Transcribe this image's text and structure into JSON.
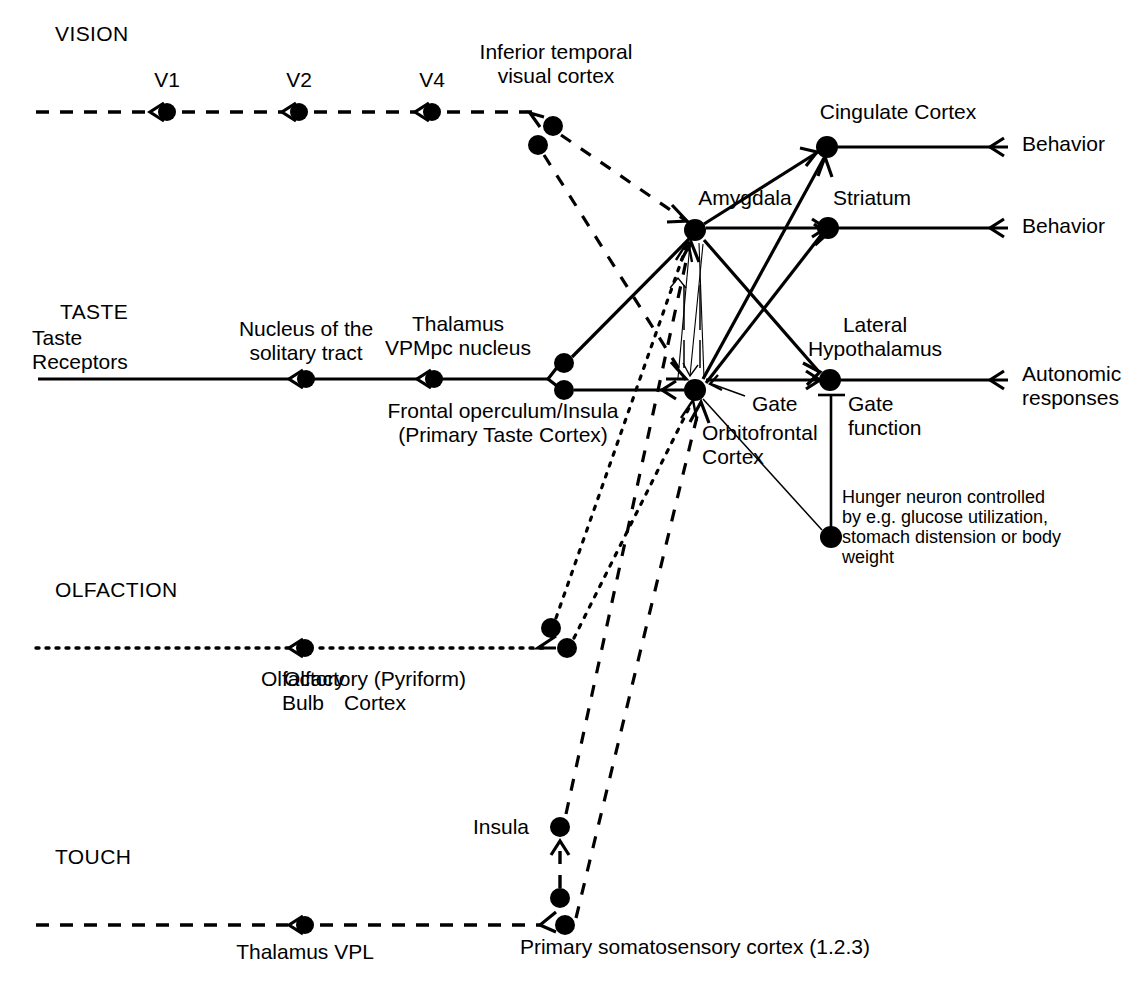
{
  "figure": {
    "domain": "brain-pathway-diagram"
  },
  "sections": [
    {
      "id": "vision",
      "label": "VISION",
      "x": 55,
      "y": 22
    },
    {
      "id": "taste",
      "label": "TASTE",
      "x": 60,
      "y": 300
    },
    {
      "id": "olfaction",
      "label": "OLFACTION",
      "x": 55,
      "y": 578
    },
    {
      "id": "touch",
      "label": "TOUCH",
      "x": 55,
      "y": 845
    }
  ],
  "labels": [
    {
      "id": "taste-receptors",
      "text": "Taste\nReceptors",
      "x": 32,
      "y": 326,
      "align": "left",
      "w": 130
    },
    {
      "id": "v1",
      "text": "V1",
      "x": 167,
      "y": 68,
      "align": "center",
      "w": 60
    },
    {
      "id": "v2",
      "text": "V2",
      "x": 299,
      "y": 68,
      "align": "center",
      "w": 60
    },
    {
      "id": "v4",
      "text": "V4",
      "x": 432,
      "y": 68,
      "align": "center",
      "w": 60
    },
    {
      "id": "it-cortex",
      "text": "Inferior temporal\nvisual cortex",
      "x": 556,
      "y": 40,
      "align": "center",
      "w": 220
    },
    {
      "id": "cingulate-cortex",
      "text": "Cingulate Cortex",
      "x": 898,
      "y": 100,
      "align": "center",
      "w": 220
    },
    {
      "id": "amygdala",
      "text": "Amygdala",
      "x": 745,
      "y": 186,
      "align": "center",
      "w": 150
    },
    {
      "id": "striatum",
      "text": "Striatum",
      "x": 872,
      "y": 186,
      "align": "center",
      "w": 140
    },
    {
      "id": "behavior-1",
      "text": "Behavior",
      "x": 1022,
      "y": 132,
      "align": "left",
      "w": 150
    },
    {
      "id": "behavior-2",
      "text": "Behavior",
      "x": 1022,
      "y": 214,
      "align": "left",
      "w": 150
    },
    {
      "id": "nucleus-solitary",
      "text": "Nucleus of the\nsolitary tract",
      "x": 306,
      "y": 317,
      "align": "center",
      "w": 200
    },
    {
      "id": "thalamus-vpmpc",
      "text": "Thalamus\nVPMpc nucleus",
      "x": 458,
      "y": 312,
      "align": "center",
      "w": 220
    },
    {
      "id": "lateral-hypo",
      "text": "Lateral\nHypothalamus",
      "x": 875,
      "y": 313,
      "align": "center",
      "w": 190
    },
    {
      "id": "autonomic",
      "text": "Autonomic\nresponses",
      "x": 1022,
      "y": 362,
      "align": "left",
      "w": 160
    },
    {
      "id": "frontal-operculum",
      "text": "Frontal operculum/Insula\n(Primary Taste Cortex)",
      "x": 503,
      "y": 399,
      "align": "center",
      "w": 330
    },
    {
      "id": "gate",
      "text": "Gate",
      "x": 752,
      "y": 392,
      "align": "left",
      "w": 90
    },
    {
      "id": "gate-function",
      "text": "Gate\nfunction",
      "x": 848,
      "y": 392,
      "align": "left",
      "w": 120
    },
    {
      "id": "orbitofrontal",
      "text": "Orbitofrontal\nCortex",
      "x": 702,
      "y": 421,
      "align": "left",
      "w": 180
    },
    {
      "id": "hunger-neuron",
      "text": "Hunger neuron controlled\nby e.g. glucose utilization,\nstomach distension or body\nweight",
      "x": 842,
      "y": 487,
      "align": "left",
      "w": 250,
      "size": 18
    },
    {
      "id": "olfactory-bulb",
      "text": "Olfactory\nBulb",
      "x": 303,
      "y": 667,
      "align": "center",
      "w": 160
    },
    {
      "id": "olfactory-cortex",
      "text": "Olfactory (Pyriform)\nCortex",
      "x": 375,
      "y": 667,
      "align": "center",
      "w": 290
    },
    {
      "id": "insula",
      "text": "Insula",
      "x": 473,
      "y": 815,
      "align": "left",
      "w": 90
    },
    {
      "id": "thalamus-vpl",
      "text": "Thalamus VPL",
      "x": 305,
      "y": 940,
      "align": "center",
      "w": 210
    },
    {
      "id": "somatosensory",
      "text": "Primary somatosensory cortex (1.2.3)",
      "x": 695,
      "y": 935,
      "align": "center",
      "w": 500
    }
  ],
  "nodes": [
    {
      "id": "v1",
      "label": "V1",
      "x": 167,
      "y": 112,
      "r": 9
    },
    {
      "id": "v2",
      "label": "V2",
      "x": 299,
      "y": 112,
      "r": 9
    },
    {
      "id": "v4",
      "label": "V4",
      "x": 432,
      "y": 112,
      "r": 9
    },
    {
      "id": "it-upper",
      "label": "Inferior temporal visual cortex",
      "x": 553,
      "y": 126,
      "r": 10
    },
    {
      "id": "it-lower",
      "label": "Inferior temporal visual cortex",
      "x": 538,
      "y": 145,
      "r": 10
    },
    {
      "id": "nucleus-solitary",
      "label": "Nucleus of the solitary tract",
      "x": 306,
      "y": 379,
      "r": 9
    },
    {
      "id": "thalamus-vpmpc",
      "label": "Thalamus VPMpc nucleus",
      "x": 434,
      "y": 379,
      "r": 9
    },
    {
      "id": "operculum-upper",
      "label": "Frontal operculum/Insula",
      "x": 564,
      "y": 363,
      "r": 10
    },
    {
      "id": "operculum-lower",
      "label": "Frontal operculum/Insula",
      "x": 564,
      "y": 390,
      "r": 10
    },
    {
      "id": "amygdala",
      "label": "Amygdala",
      "x": 695,
      "y": 230,
      "r": 11
    },
    {
      "id": "cingulate",
      "label": "Cingulate Cortex",
      "x": 827,
      "y": 147,
      "r": 11
    },
    {
      "id": "striatum",
      "label": "Striatum",
      "x": 828,
      "y": 228,
      "r": 11
    },
    {
      "id": "orbitofrontal",
      "label": "Orbitofrontal Cortex",
      "x": 695,
      "y": 390,
      "r": 11
    },
    {
      "id": "lateral-hypo",
      "label": "Lateral Hypothalamus",
      "x": 830,
      "y": 380,
      "r": 11
    },
    {
      "id": "hunger",
      "label": "Hunger neuron",
      "x": 831,
      "y": 537,
      "r": 11
    },
    {
      "id": "olfactory-bulb",
      "label": "Olfactory Bulb",
      "x": 305,
      "y": 648,
      "r": 9
    },
    {
      "id": "pyriform-upper",
      "label": "Olfactory (Pyriform) Cortex",
      "x": 551,
      "y": 628,
      "r": 10
    },
    {
      "id": "pyriform-lower",
      "label": "Olfactory (Pyriform) Cortex",
      "x": 567,
      "y": 648,
      "r": 10
    },
    {
      "id": "insula",
      "label": "Insula",
      "x": 560,
      "y": 827,
      "r": 10
    },
    {
      "id": "somato-upper",
      "label": "Primary somatosensory cortex",
      "x": 560,
      "y": 898,
      "r": 10
    },
    {
      "id": "somato-lower",
      "label": "Primary somatosensory cortex",
      "x": 565,
      "y": 925,
      "r": 10
    },
    {
      "id": "thalamus-vpl",
      "label": "Thalamus VPL",
      "x": 305,
      "y": 925,
      "r": 9
    }
  ],
  "pathways": [
    {
      "id": "vision-pathway",
      "style": "dashed",
      "label": "VISION"
    },
    {
      "id": "taste-pathway",
      "style": "solid",
      "label": "TASTE"
    },
    {
      "id": "olfaction-pathway",
      "style": "dotted",
      "label": "OLFACTION"
    },
    {
      "id": "touch-pathway",
      "style": "dashed",
      "label": "TOUCH"
    }
  ],
  "outputs": [
    {
      "id": "behavior-1",
      "text": "Behavior",
      "from": "cingulate"
    },
    {
      "id": "behavior-2",
      "text": "Behavior",
      "from": "striatum"
    },
    {
      "id": "autonomic",
      "text": "Autonomic responses",
      "from": "lateral-hypo"
    }
  ],
  "colors": {
    "ink": "#000000",
    "background": "#ffffff"
  }
}
